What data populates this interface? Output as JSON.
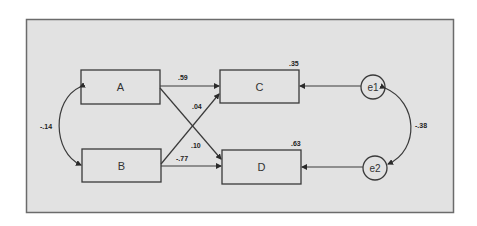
{
  "diagram": {
    "type": "path-model",
    "colors": {
      "background": "#e2e2e2",
      "frame": "#6b6b6b",
      "stroke": "#3a3a3a",
      "node_fill": "#e2e2e2"
    },
    "observed_variables": [
      {
        "id": "A",
        "label": "A"
      },
      {
        "id": "B",
        "label": "B"
      },
      {
        "id": "C",
        "label": "C",
        "r_squared": ".35"
      },
      {
        "id": "D",
        "label": "D",
        "r_squared": ".63"
      }
    ],
    "error_terms": [
      {
        "id": "e1",
        "label": "e1",
        "target": "C"
      },
      {
        "id": "e2",
        "label": "e2",
        "target": "D"
      }
    ],
    "paths": [
      {
        "from": "A",
        "to": "C",
        "coefficient": ".59"
      },
      {
        "from": "B",
        "to": "C",
        "coefficient": ".04"
      },
      {
        "from": "A",
        "to": "D",
        "coefficient": ".10"
      },
      {
        "from": "B",
        "to": "D",
        "coefficient": "-.77"
      }
    ],
    "covariances": [
      {
        "between": [
          "A",
          "B"
        ],
        "coefficient": "-.14"
      },
      {
        "between": [
          "e1",
          "e2"
        ],
        "coefficient": "-.38"
      }
    ]
  }
}
